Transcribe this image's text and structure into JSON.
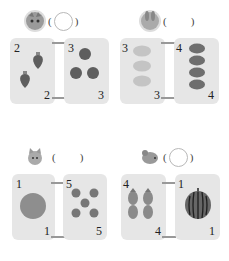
{
  "exercises": [
    {
      "animal": "cat",
      "answer_style": "circle",
      "left": {
        "count_top": "2",
        "count_bottom": "2",
        "item": "strawberry",
        "quantity": 2
      },
      "right": {
        "count_top": "3",
        "count_bottom": "3",
        "item": "apple",
        "quantity": 3
      }
    },
    {
      "animal": "rabbit",
      "answer_style": "blank",
      "left": {
        "count_top": "3",
        "count_bottom": "3",
        "item": "melon-slice",
        "quantity": 3
      },
      "right": {
        "count_top": "4",
        "count_bottom": "4",
        "item": "plum",
        "quantity": 4
      }
    },
    {
      "animal": "kitten",
      "answer_style": "blank",
      "left": {
        "count_top": "1",
        "count_bottom": "1",
        "item": "cantaloupe",
        "quantity": 1
      },
      "right": {
        "count_top": "5",
        "count_bottom": "5",
        "item": "cherry",
        "quantity": 5
      }
    },
    {
      "animal": "mouse",
      "answer_style": "circle",
      "left": {
        "count_top": "4",
        "count_bottom": "4",
        "item": "pineapple",
        "quantity": 2
      },
      "right": {
        "count_top": "1",
        "count_bottom": "1",
        "item": "watermelon",
        "quantity": 1
      }
    }
  ],
  "symbols": {
    "open_paren": "(",
    "close_paren": ")"
  },
  "colors": {
    "card": "#e6e6e6",
    "fruit_dark": "#6e6e6e",
    "fruit_light": "#bdbdbd"
  }
}
